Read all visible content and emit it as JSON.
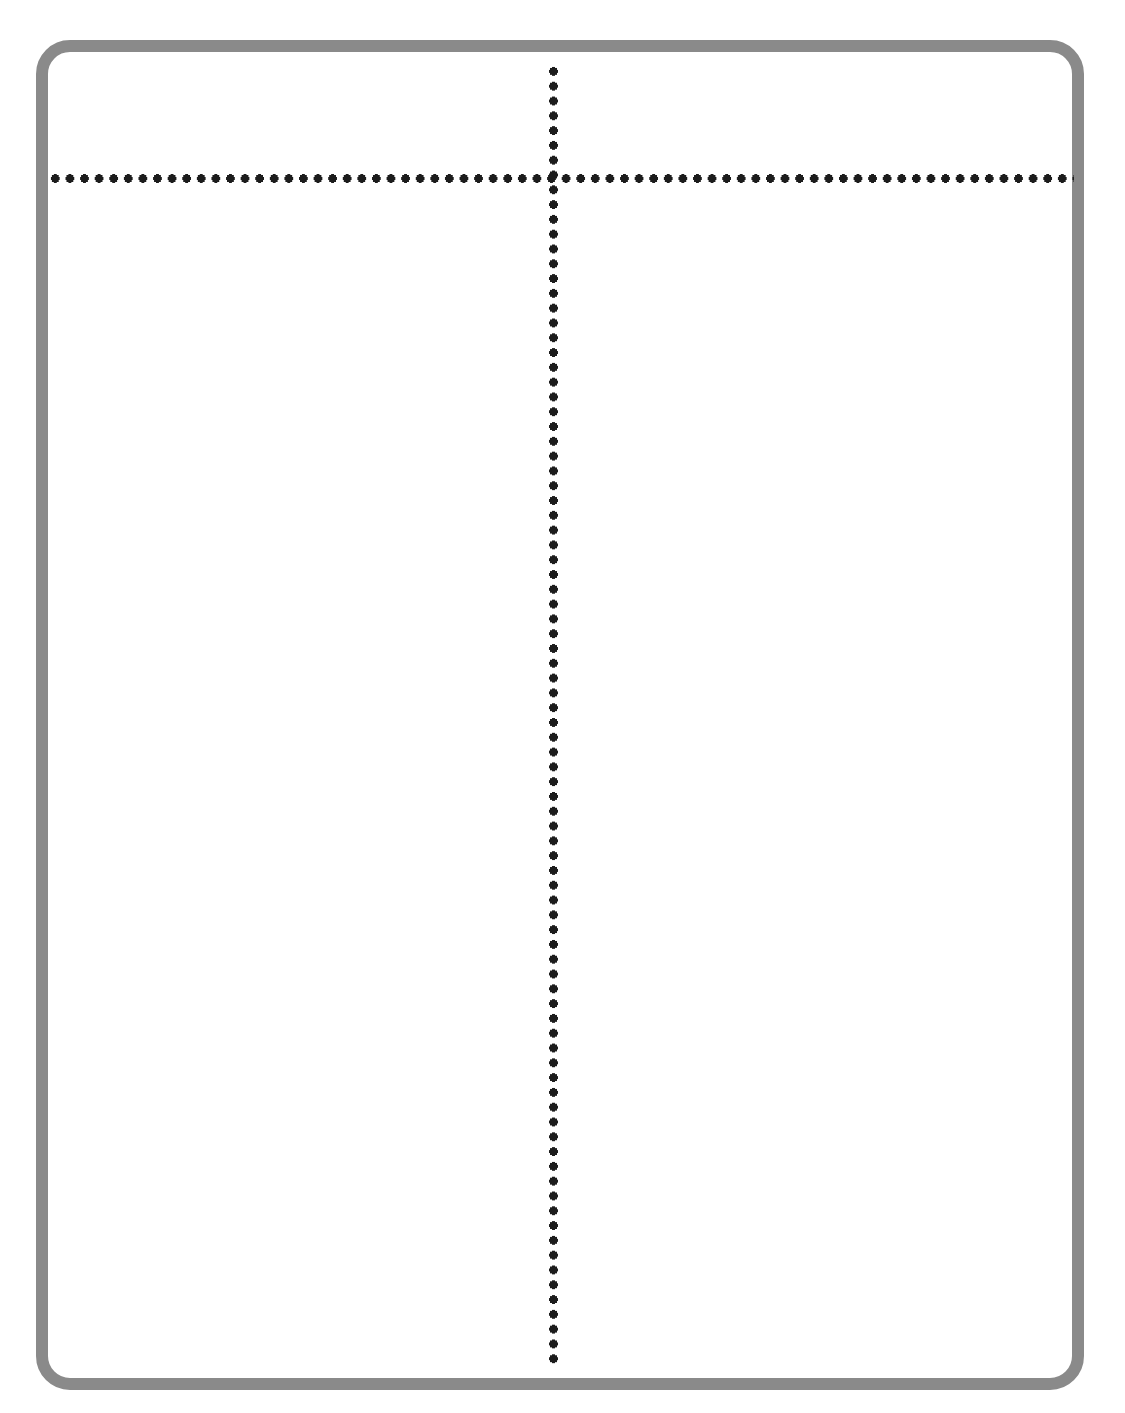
{
  "page": {
    "background_color": "#ffffff",
    "width": 1125,
    "height": 1413
  },
  "frame": {
    "name": "rounded-rectangle-frame",
    "border_color": "#8a8a8a",
    "border_width_px": 12,
    "corner_radius_px": 34,
    "fill_color": "#ffffff",
    "left_px": 36,
    "top_px": 40,
    "right_px": 1084,
    "bottom_px": 1390
  },
  "dividers": {
    "horizontal": {
      "name": "horizontal-dotted-divider",
      "style": "dotted",
      "color": "#1c1c1c",
      "dot_diameter_px": 9,
      "dot_spacing_px": 15,
      "y_px": 178,
      "x_start_px": 48,
      "x_end_px": 1074
    },
    "vertical": {
      "name": "vertical-dotted-divider",
      "style": "dotted",
      "color": "#1c1c1c",
      "dot_diameter_px": 9,
      "dot_spacing_px": 15,
      "x_px": 553,
      "y_start_px": 64,
      "y_end_px": 1366
    }
  },
  "regions": {
    "header": {
      "name": "header-row",
      "text": "",
      "placeholder": ""
    },
    "left_column": {
      "name": "left-column",
      "text": "",
      "placeholder": ""
    },
    "right_column": {
      "name": "right-column",
      "text": "",
      "placeholder": ""
    }
  }
}
